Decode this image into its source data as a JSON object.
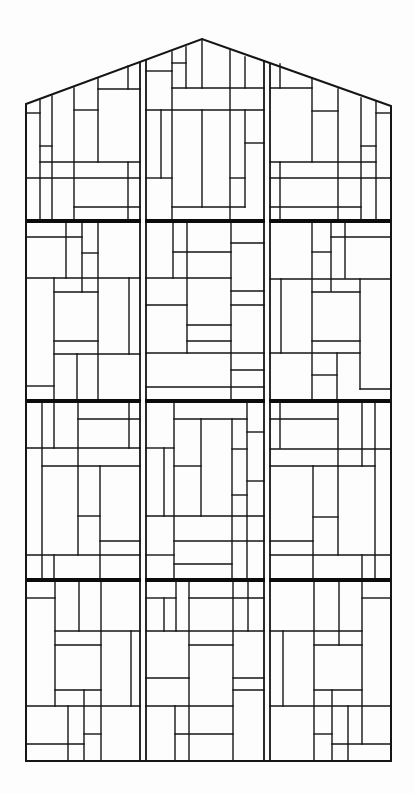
{
  "drawing": {
    "title": "Stained glass window elevation (leaded panels)",
    "width": 414,
    "height": 794,
    "background": "#fdfdfd",
    "line_color": "#151515",
    "frame": {
      "outline": [
        [
          26,
          104
        ],
        [
          202,
          39
        ],
        [
          391,
          106
        ],
        [
          391,
          761
        ],
        [
          26,
          761
        ]
      ]
    },
    "mullions": [
      {
        "name": "left-mullion",
        "x1": 140,
        "x2": 146,
        "y_top": 80,
        "y_bottom": 761
      },
      {
        "name": "right-mullion",
        "x1": 264,
        "x2": 270,
        "y_top": 80,
        "y_bottom": 761
      }
    ],
    "transom_bars": [
      {
        "name": "transom-bar-1",
        "y": 221
      },
      {
        "name": "transom-bar-2",
        "y": 401
      },
      {
        "name": "transom-bar-3",
        "y": 580
      }
    ],
    "tiers": [
      {
        "name": "tier-1-gable",
        "segments": [
          [
            40,
            100,
            40,
            221
          ],
          [
            52,
            96,
            52,
            221
          ],
          [
            74,
            88,
            74,
            221
          ],
          [
            98,
            78,
            98,
            162
          ],
          [
            128,
            66,
            128,
            89
          ],
          [
            26,
            113,
            40,
            113
          ],
          [
            40,
            146,
            52,
            146
          ],
          [
            40,
            162,
            140,
            162
          ],
          [
            74,
            110,
            98,
            110
          ],
          [
            98,
            89,
            140,
            89
          ],
          [
            26,
            178,
            140,
            178
          ],
          [
            74,
            207,
            140,
            207
          ],
          [
            128,
            162,
            128,
            221
          ],
          [
            172,
            52,
            172,
            221
          ],
          [
            186,
            47,
            186,
            88
          ],
          [
            202,
            39,
            202,
            88
          ],
          [
            230,
            50,
            230,
            221
          ],
          [
            245,
            57,
            245,
            88
          ],
          [
            146,
            71,
            172,
            71
          ],
          [
            172,
            63,
            186,
            63
          ],
          [
            172,
            88,
            264,
            88
          ],
          [
            146,
            110,
            264,
            110
          ],
          [
            161,
            110,
            161,
            178
          ],
          [
            202,
            110,
            202,
            207
          ],
          [
            245,
            110,
            245,
            207
          ],
          [
            146,
            178,
            172,
            178
          ],
          [
            245,
            143,
            264,
            143
          ],
          [
            230,
            178,
            245,
            178
          ],
          [
            172,
            207,
            245,
            207
          ],
          [
            280,
            64,
            280,
            88
          ],
          [
            312,
            78,
            312,
            162
          ],
          [
            338,
            89,
            338,
            221
          ],
          [
            361,
            98,
            361,
            221
          ],
          [
            376,
            101,
            376,
            221
          ],
          [
            270,
            88,
            312,
            88
          ],
          [
            312,
            111,
            338,
            111
          ],
          [
            361,
            146,
            376,
            146
          ],
          [
            376,
            113,
            391,
            113
          ],
          [
            270,
            162,
            376,
            162
          ],
          [
            270,
            178,
            391,
            178
          ],
          [
            270,
            207,
            361,
            207
          ],
          [
            280,
            162,
            280,
            221
          ]
        ]
      },
      {
        "name": "tier-2",
        "segments": [
          [
            66,
            221,
            66,
            278
          ],
          [
            82,
            221,
            82,
            292
          ],
          [
            98,
            221,
            98,
            401
          ],
          [
            26,
            237,
            82,
            237
          ],
          [
            82,
            253,
            98,
            253
          ],
          [
            26,
            278,
            140,
            278
          ],
          [
            54,
            278,
            54,
            401
          ],
          [
            54,
            292,
            98,
            292
          ],
          [
            54,
            341,
            98,
            341
          ],
          [
            54,
            354,
            140,
            354
          ],
          [
            77,
            354,
            77,
            401
          ],
          [
            129,
            278,
            129,
            354
          ],
          [
            26,
            386,
            54,
            386
          ],
          [
            173,
            221,
            173,
            278
          ],
          [
            187,
            221,
            187,
            353
          ],
          [
            231,
            221,
            231,
            401
          ],
          [
            173,
            252,
            231,
            252
          ],
          [
            146,
            278,
            231,
            278
          ],
          [
            146,
            305,
            187,
            305
          ],
          [
            187,
            325,
            231,
            325
          ],
          [
            187,
            341,
            231,
            341
          ],
          [
            146,
            353,
            264,
            353
          ],
          [
            146,
            387,
            264,
            387
          ],
          [
            231,
            243,
            264,
            243
          ],
          [
            231,
            291,
            264,
            291
          ],
          [
            231,
            305,
            264,
            305
          ],
          [
            231,
            370,
            264,
            370
          ],
          [
            312,
            221,
            312,
            401
          ],
          [
            331,
            221,
            331,
            291
          ],
          [
            345,
            221,
            345,
            278
          ],
          [
            331,
            237,
            391,
            237
          ],
          [
            312,
            252,
            331,
            252
          ],
          [
            270,
            279,
            391,
            279
          ],
          [
            281,
            279,
            281,
            353
          ],
          [
            312,
            292,
            360,
            292
          ],
          [
            360,
            279,
            360,
            389
          ],
          [
            312,
            341,
            360,
            341
          ],
          [
            270,
            353,
            360,
            353
          ],
          [
            337,
            353,
            337,
            401
          ],
          [
            312,
            375,
            337,
            375
          ],
          [
            360,
            389,
            391,
            389
          ]
        ]
      },
      {
        "name": "tier-3",
        "segments": [
          [
            42,
            401,
            42,
            580
          ],
          [
            54,
            401,
            54,
            448
          ],
          [
            54,
            555,
            54,
            580
          ],
          [
            78,
            401,
            78,
            555
          ],
          [
            78,
            419,
            140,
            419
          ],
          [
            129,
            401,
            129,
            448
          ],
          [
            26,
            448,
            140,
            448
          ],
          [
            42,
            466,
            140,
            466
          ],
          [
            100,
            466,
            100,
            580
          ],
          [
            78,
            516,
            100,
            516
          ],
          [
            100,
            541,
            140,
            541
          ],
          [
            26,
            555,
            140,
            555
          ],
          [
            174,
            401,
            174,
            580
          ],
          [
            174,
            419,
            247,
            419
          ],
          [
            247,
            401,
            247,
            580
          ],
          [
            201,
            419,
            201,
            516
          ],
          [
            232,
            419,
            232,
            580
          ],
          [
            247,
            432,
            264,
            432
          ],
          [
            232,
            449,
            247,
            449
          ],
          [
            146,
            448,
            174,
            448
          ],
          [
            164,
            448,
            164,
            516
          ],
          [
            174,
            466,
            201,
            466
          ],
          [
            247,
            481,
            264,
            481
          ],
          [
            232,
            495,
            247,
            495
          ],
          [
            146,
            516,
            264,
            516
          ],
          [
            174,
            541,
            264,
            541
          ],
          [
            146,
            555,
            174,
            555
          ],
          [
            174,
            564,
            232,
            564
          ],
          [
            280,
            401,
            280,
            448
          ],
          [
            270,
            419,
            338,
            419
          ],
          [
            338,
            401,
            338,
            555
          ],
          [
            362,
            401,
            362,
            466
          ],
          [
            362,
            555,
            362,
            580
          ],
          [
            375,
            401,
            375,
            580
          ],
          [
            270,
            449,
            391,
            449
          ],
          [
            270,
            466,
            375,
            466
          ],
          [
            313,
            466,
            313,
            580
          ],
          [
            313,
            517,
            338,
            517
          ],
          [
            270,
            541,
            313,
            541
          ],
          [
            270,
            555,
            391,
            555
          ]
        ]
      },
      {
        "name": "tier-4",
        "segments": [
          [
            26,
            598,
            55,
            598
          ],
          [
            55,
            580,
            55,
            706
          ],
          [
            79,
            580,
            79,
            631
          ],
          [
            101,
            580,
            101,
            761
          ],
          [
            55,
            631,
            140,
            631
          ],
          [
            55,
            645,
            101,
            645
          ],
          [
            131,
            631,
            131,
            706
          ],
          [
            55,
            690,
            101,
            690
          ],
          [
            84,
            690,
            84,
            761
          ],
          [
            26,
            706,
            140,
            706
          ],
          [
            68,
            706,
            68,
            761
          ],
          [
            84,
            734,
            101,
            734
          ],
          [
            26,
            744,
            84,
            744
          ],
          [
            176,
            580,
            176,
            631
          ],
          [
            146,
            598,
            176,
            598
          ],
          [
            164,
            598,
            164,
            631
          ],
          [
            189,
            580,
            189,
            761
          ],
          [
            233,
            580,
            233,
            761
          ],
          [
            248,
            580,
            248,
            631
          ],
          [
            189,
            598,
            264,
            598
          ],
          [
            146,
            631,
            264,
            631
          ],
          [
            189,
            645,
            233,
            645
          ],
          [
            146,
            678,
            189,
            678
          ],
          [
            233,
            678,
            264,
            678
          ],
          [
            233,
            690,
            264,
            690
          ],
          [
            146,
            706,
            233,
            706
          ],
          [
            175,
            706,
            175,
            761
          ],
          [
            175,
            734,
            233,
            734
          ],
          [
            283,
            631,
            283,
            706
          ],
          [
            314,
            580,
            314,
            761
          ],
          [
            339,
            580,
            339,
            645
          ],
          [
            362,
            580,
            362,
            744
          ],
          [
            362,
            598,
            391,
            598
          ],
          [
            270,
            631,
            362,
            631
          ],
          [
            314,
            645,
            362,
            645
          ],
          [
            314,
            690,
            362,
            690
          ],
          [
            332,
            690,
            332,
            761
          ],
          [
            270,
            706,
            391,
            706
          ],
          [
            348,
            706,
            348,
            761
          ],
          [
            314,
            734,
            332,
            734
          ],
          [
            332,
            744,
            391,
            744
          ]
        ]
      }
    ]
  }
}
